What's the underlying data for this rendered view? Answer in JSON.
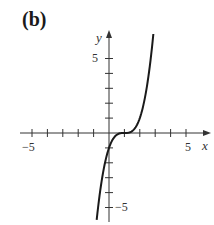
{
  "panel": {
    "label": "(b)"
  },
  "chart_data": {
    "type": "line",
    "title": "",
    "panel_label": "(b)",
    "xlabel": "x",
    "ylabel": "y",
    "xlim": [
      -6,
      6
    ],
    "ylim": [
      -6,
      8
    ],
    "x_ticks": [
      -5,
      -4,
      -3,
      -2,
      -1,
      1,
      2,
      3,
      4,
      5
    ],
    "y_ticks": [
      -5,
      -4,
      -3,
      -2,
      -1,
      1,
      2,
      3,
      4,
      5
    ],
    "x_tick_labels": [
      "-5",
      "5"
    ],
    "y_tick_labels": [
      "5",
      "-5"
    ],
    "grid": false,
    "legend": null,
    "series": [
      {
        "name": "y = (x - 1)^3",
        "x": [
          -0.8,
          -0.5,
          0,
          0.5,
          1,
          1.5,
          2,
          2.5,
          2.88
        ],
        "y": [
          -5.83,
          -3.38,
          -1,
          -0.125,
          0,
          0.125,
          1,
          3.38,
          6.65
        ]
      }
    ]
  },
  "axis": {
    "x_name": "x",
    "y_name": "y",
    "x_min_label": "−5",
    "x_max_label": "5",
    "y_max_label": "5",
    "y_min_label": "−5"
  }
}
